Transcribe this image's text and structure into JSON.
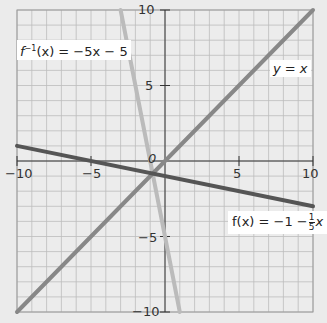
{
  "chart_data": {
    "type": "line",
    "title": "",
    "xlabel": "",
    "ylabel": "",
    "xlim": [
      -10,
      10
    ],
    "ylim": [
      -10,
      10
    ],
    "grid": true,
    "grid_step": 1,
    "x_ticks": [
      -10,
      -5,
      0,
      5,
      10
    ],
    "y_ticks": [
      -10,
      -5,
      0,
      5,
      10
    ],
    "x_tick_labels": [
      "-10",
      "-5",
      "5",
      "10"
    ],
    "y_tick_labels": [
      "10",
      "5",
      "-5",
      "-10"
    ],
    "origin_label": "0",
    "series": [
      {
        "name": "f(x) = -1 - (1/5)x",
        "label": "f(x) = −1 − 1/5 x",
        "color": "#555555",
        "x": [
          -10,
          10
        ],
        "y": [
          1,
          -3
        ]
      },
      {
        "name": "y = x",
        "label": "y = x",
        "color": "#888888",
        "x": [
          -10,
          10
        ],
        "y": [
          -10,
          10
        ]
      },
      {
        "name": "f^-1(x) = -5x - 5",
        "label": "f⁻¹(x) = −5x − 5",
        "color": "#bbbbbb",
        "x": [
          -3,
          1
        ],
        "y": [
          10,
          -10
        ]
      }
    ],
    "annotations": [
      "f⁻¹(x) = −5x − 5",
      "y = x",
      "f(x) = −1 − 1/5 x"
    ]
  },
  "labels": {
    "finv_prefix": "f",
    "finv_sup": "−1",
    "finv_rest": "(x) = −5x − 5",
    "yx": "y = x",
    "f_prefix": "f(x) = −1 −",
    "f_num": "1",
    "f_den": "5",
    "f_suffix": "x"
  },
  "ticks": {
    "xm10": "−10",
    "xm5": "−5",
    "x5": "5",
    "x10": "10",
    "y10": "10",
    "y5": "5",
    "ym5": "−5",
    "ym10": "−10",
    "origin": "0"
  }
}
